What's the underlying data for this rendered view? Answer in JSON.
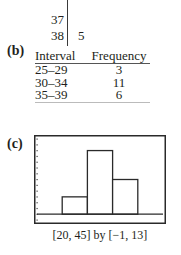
{
  "stem_and_leaf": {
    "rows": [
      {
        "stem": "37",
        "leaves": ""
      },
      {
        "stem": "38",
        "leaves": "5"
      }
    ]
  },
  "parts": {
    "b": "(b)",
    "c": "(c)"
  },
  "frequency_table": {
    "headers": [
      "Interval",
      "Frequency"
    ],
    "rows": [
      {
        "interval": "25–29",
        "frequency": "3"
      },
      {
        "interval": "30–34",
        "frequency": "11"
      },
      {
        "interval": "35–39",
        "frequency": "6"
      }
    ]
  },
  "chart_data": {
    "type": "bar",
    "subtype": "histogram",
    "categories": [
      "25–29",
      "30–34",
      "35–39"
    ],
    "bins": [
      [
        25,
        30
      ],
      [
        30,
        35
      ],
      [
        35,
        40
      ]
    ],
    "values": [
      3,
      11,
      6
    ],
    "title": "",
    "xlabel": "",
    "ylabel": "",
    "xlim": [
      20,
      45
    ],
    "ylim": [
      -1,
      13
    ],
    "yscale_ticks": 1,
    "grid": false,
    "legend": "none",
    "caption": "[20, 45] by [−1, 13]"
  }
}
